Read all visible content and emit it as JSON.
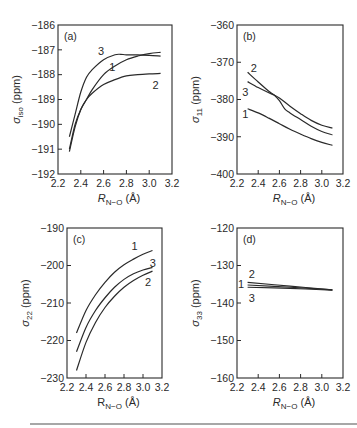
{
  "figure": {
    "background": "#ffffff",
    "ink_color": "#2a2a2a",
    "rule_color": "#8a8a8a"
  },
  "chart_data": [
    {
      "type": "line",
      "panel": "(a)",
      "title": "",
      "xlabel": "R_N−O (Å)",
      "xlabel_italic": true,
      "ylabel": "σ_iso (ppm)",
      "xlim": [
        2.2,
        3.2
      ],
      "ylim": [
        -192,
        -186
      ],
      "xticks": [
        2.2,
        2.4,
        2.6,
        2.8,
        3.0,
        3.2
      ],
      "xtick_labels": [
        "2.2",
        "2.4",
        "2.6",
        "2.8",
        "3.0",
        "3.2"
      ],
      "yticks": [
        -186,
        -187,
        -188,
        -189,
        -190,
        -191,
        -192
      ],
      "ytick_labels": [
        "−186",
        "−187",
        "−188",
        "−189",
        "−190",
        "−191",
        "−192"
      ],
      "grid": false,
      "box": {
        "x0": 58,
        "y0": 25,
        "x1": 172,
        "y1": 174
      },
      "series": [
        {
          "name": "1",
          "x": [
            2.3,
            2.35,
            2.4,
            2.45,
            2.5,
            2.6,
            2.7,
            2.8,
            2.9,
            3.0,
            3.1
          ],
          "values": [
            -191.0,
            -190.0,
            -189.4,
            -189.0,
            -188.6,
            -188.0,
            -187.65,
            -187.4,
            -187.25,
            -187.15,
            -187.1
          ],
          "label_pos": [
            2.65,
            -187.7
          ]
        },
        {
          "name": "2",
          "x": [
            2.3,
            2.35,
            2.4,
            2.45,
            2.5,
            2.6,
            2.7,
            2.8,
            2.9,
            3.0,
            3.1
          ],
          "values": [
            -191.1,
            -190.1,
            -189.4,
            -189.0,
            -188.75,
            -188.4,
            -188.2,
            -188.05,
            -188.0,
            -187.97,
            -187.95
          ],
          "label_pos": [
            3.03,
            -188.4
          ]
        },
        {
          "name": "3",
          "x": [
            2.3,
            2.35,
            2.4,
            2.45,
            2.5,
            2.6,
            2.7,
            2.75,
            2.8,
            2.9,
            3.0,
            3.1
          ],
          "values": [
            -190.5,
            -189.6,
            -188.7,
            -188.1,
            -187.8,
            -187.4,
            -187.2,
            -187.18,
            -187.2,
            -187.2,
            -187.22,
            -187.25
          ],
          "label_pos": [
            2.55,
            -187.05
          ]
        }
      ]
    },
    {
      "type": "line",
      "panel": "(b)",
      "title": "",
      "xlabel": "R_N−O (Å)",
      "xlabel_italic": true,
      "ylabel": "σ_11 (ppm)",
      "xlim": [
        2.2,
        3.2
      ],
      "ylim": [
        -400,
        -360
      ],
      "xticks": [
        2.2,
        2.4,
        2.6,
        2.8,
        3.0,
        3.2
      ],
      "xtick_labels": [
        "2.2",
        "2.4",
        "2.6",
        "2.8",
        "3.0",
        "3.2"
      ],
      "yticks": [
        -360,
        -370,
        -380,
        -390,
        -400
      ],
      "ytick_labels": [
        "−360",
        "−370",
        "−380",
        "−390",
        "−400"
      ],
      "grid": false,
      "box": {
        "x0": 237,
        "y0": 25,
        "x1": 343,
        "y1": 174
      },
      "series": [
        {
          "name": "1",
          "x": [
            2.3,
            2.4,
            2.5,
            2.6,
            2.7,
            2.8,
            2.9,
            3.0,
            3.1
          ],
          "values": [
            -382.5,
            -383.6,
            -385.0,
            -386.5,
            -388.0,
            -389.3,
            -390.5,
            -391.5,
            -392.3
          ],
          "label_pos": [
            2.25,
            -383.8
          ]
        },
        {
          "name": "2",
          "x": [
            2.3,
            2.4,
            2.5,
            2.55,
            2.6,
            2.65,
            2.7,
            2.8,
            2.9,
            3.0,
            3.1
          ],
          "values": [
            -372.7,
            -375.3,
            -377.8,
            -378.8,
            -380.3,
            -382.5,
            -383.6,
            -385.4,
            -387.2,
            -388.6,
            -389.5
          ],
          "label_pos": [
            2.33,
            -371.5
          ]
        },
        {
          "name": "3",
          "x": [
            2.3,
            2.4,
            2.5,
            2.55,
            2.6,
            2.7,
            2.8,
            2.9,
            3.0,
            3.1
          ],
          "values": [
            -375.2,
            -376.8,
            -378.2,
            -378.8,
            -379.6,
            -381.8,
            -383.8,
            -385.6,
            -386.9,
            -387.7
          ],
          "label_pos": [
            2.25,
            -378.0
          ]
        }
      ]
    },
    {
      "type": "line",
      "panel": "(c)",
      "title": "",
      "xlabel": "R_N−O (Å)",
      "xlabel_italic": false,
      "ylabel": "σ_22 (ppm)",
      "xlim": [
        2.2,
        3.2
      ],
      "ylim": [
        -230,
        -190
      ],
      "xticks": [
        2.2,
        2.4,
        2.6,
        2.8,
        3.0,
        3.2
      ],
      "xtick_labels": [
        "2.2",
        "2.4",
        "2.6",
        "2.8",
        "3.0",
        "3.2"
      ],
      "yticks": [
        -190,
        -200,
        -210,
        -220,
        -230
      ],
      "ytick_labels": [
        "−190",
        "−200",
        "−210",
        "−220",
        "−230"
      ],
      "grid": false,
      "box": {
        "x0": 67,
        "y0": 228,
        "x1": 162,
        "y1": 378
      },
      "series": [
        {
          "name": "1",
          "x": [
            2.3,
            2.4,
            2.5,
            2.6,
            2.7,
            2.8,
            2.9,
            3.0,
            3.1
          ],
          "values": [
            -218.0,
            -212.0,
            -207.8,
            -204.5,
            -201.8,
            -199.8,
            -198.3,
            -197.0,
            -196.0
          ],
          "label_pos": [
            2.88,
            -194.8
          ]
        },
        {
          "name": "2",
          "x": [
            2.3,
            2.4,
            2.5,
            2.6,
            2.7,
            2.8,
            2.9,
            3.0,
            3.1
          ],
          "values": [
            -228.0,
            -220.5,
            -215.2,
            -211.2,
            -208.2,
            -205.8,
            -204.0,
            -202.6,
            -201.5
          ],
          "label_pos": [
            3.02,
            -204.5
          ]
        },
        {
          "name": "3",
          "x": [
            2.3,
            2.4,
            2.5,
            2.6,
            2.7,
            2.8,
            2.9,
            3.0,
            3.1
          ],
          "values": [
            -223.0,
            -216.5,
            -212.0,
            -208.6,
            -205.8,
            -203.7,
            -202.2,
            -201.2,
            -200.5
          ],
          "label_pos": [
            3.07,
            -199.2
          ]
        }
      ]
    },
    {
      "type": "line",
      "panel": "(d)",
      "title": "",
      "xlabel": "R_N−O (Å)",
      "xlabel_italic": true,
      "ylabel": "σ_33 (ppm)",
      "xlim": [
        2.2,
        3.2
      ],
      "ylim": [
        -160,
        -120
      ],
      "xticks": [
        2.2,
        2.4,
        2.6,
        2.8,
        3.0,
        3.2
      ],
      "xtick_labels": [
        "2.2",
        "2.4",
        "2.6",
        "2.8",
        "3.0",
        "3.2"
      ],
      "yticks": [
        -120,
        -130,
        -140,
        -150,
        -160
      ],
      "ytick_labels": [
        "−120",
        "−130",
        "−140",
        "−150",
        "−160"
      ],
      "grid": false,
      "box": {
        "x0": 237,
        "y0": 228,
        "x1": 343,
        "y1": 378
      },
      "series": [
        {
          "name": "1",
          "x": [
            2.3,
            2.7,
            3.1
          ],
          "values": [
            -135.2,
            -135.8,
            -136.5
          ],
          "label_pos": [
            2.21,
            -135.0
          ]
        },
        {
          "name": "2",
          "x": [
            2.3,
            2.7,
            3.1
          ],
          "values": [
            -134.5,
            -135.5,
            -136.5
          ],
          "label_pos": [
            2.31,
            -132.3
          ]
        },
        {
          "name": "3",
          "x": [
            2.3,
            2.7,
            3.1
          ],
          "values": [
            -135.8,
            -136.1,
            -136.6
          ],
          "label_pos": [
            2.31,
            -138.6
          ]
        }
      ]
    }
  ]
}
